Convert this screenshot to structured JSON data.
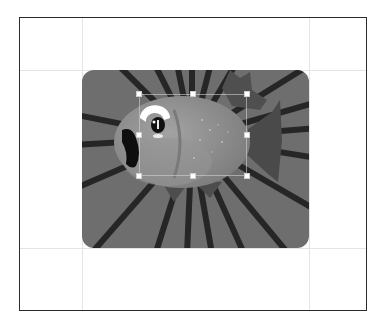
{
  "canvas": {
    "frame_color": "#2b2b2b",
    "grid_color": "#e4e4e4",
    "grid_lines_x": [
      82,
      309
    ],
    "grid_lines_y": [
      70,
      248
    ]
  },
  "artwork": {
    "description": "fish-on-sunburst-clipart",
    "background_color": "#6e6e6e",
    "ray_color": "#262626",
    "fish_body_color": "#8c8c8c",
    "corner_radius": 12
  },
  "selection": {
    "left": 139,
    "top": 94,
    "right": 247,
    "bottom": 176,
    "handles": [
      {
        "name": "handle-top-left",
        "x": 139,
        "y": 94
      },
      {
        "name": "handle-top-center",
        "x": 193,
        "y": 94
      },
      {
        "name": "handle-top-right",
        "x": 247,
        "y": 94
      },
      {
        "name": "handle-middle-left",
        "x": 139,
        "y": 135
      },
      {
        "name": "handle-middle-right",
        "x": 247,
        "y": 135
      },
      {
        "name": "handle-bottom-left",
        "x": 139,
        "y": 176
      },
      {
        "name": "handle-bottom-center",
        "x": 193,
        "y": 176
      },
      {
        "name": "handle-bottom-right",
        "x": 247,
        "y": 176
      }
    ]
  }
}
